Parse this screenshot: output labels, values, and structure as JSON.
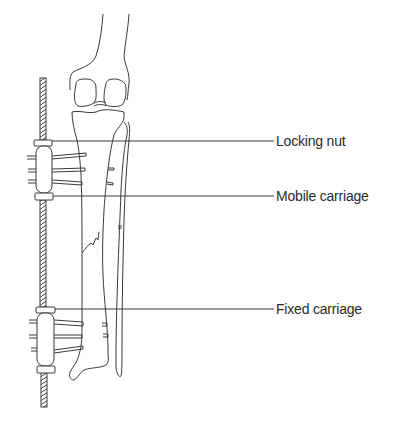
{
  "figure": {
    "labels": [
      {
        "id": "locking-nut",
        "text": "Locking nut",
        "leader_y": 141,
        "text_x": 275,
        "text_y": 133
      },
      {
        "id": "mobile-carriage",
        "text": "Mobile carriage",
        "leader_y": 196,
        "text_x": 275,
        "text_y": 188
      },
      {
        "id": "fixed-carriage",
        "text": "Fixed carriage",
        "leader_y": 309,
        "text_x": 275,
        "text_y": 301
      }
    ],
    "colors": {
      "line": "#3a3a3a",
      "text": "#2a2a2a",
      "background": "#ffffff"
    }
  }
}
